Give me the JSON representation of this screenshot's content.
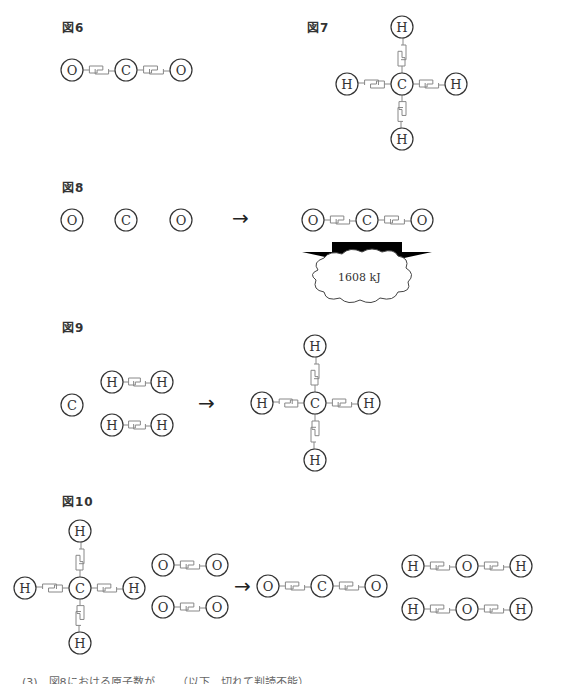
{
  "figures": {
    "fig6": {
      "label": "図6",
      "molecule": "O=C=O",
      "atoms": [
        {
          "symbol": "O",
          "x": 72,
          "y": 70
        },
        {
          "symbol": "C",
          "x": 126,
          "y": 70
        },
        {
          "symbol": "O",
          "x": 181,
          "y": 70
        }
      ],
      "bonds": [
        [
          0,
          1
        ],
        [
          1,
          2
        ]
      ]
    },
    "fig7": {
      "label": "図7",
      "molecule": "CH4",
      "atoms": [
        {
          "symbol": "C",
          "x": 402,
          "y": 84
        },
        {
          "symbol": "H",
          "x": 402,
          "y": 27
        },
        {
          "symbol": "H",
          "x": 347,
          "y": 84
        },
        {
          "symbol": "H",
          "x": 456,
          "y": 84
        },
        {
          "symbol": "H",
          "x": 402,
          "y": 139
        }
      ],
      "bonds": [
        [
          0,
          1
        ],
        [
          0,
          2
        ],
        [
          0,
          3
        ],
        [
          0,
          4
        ]
      ]
    },
    "fig8": {
      "label": "図8",
      "reactants": [
        {
          "symbol": "O",
          "x": 72,
          "y": 220
        },
        {
          "symbol": "C",
          "x": 126,
          "y": 220
        },
        {
          "symbol": "O",
          "x": 181,
          "y": 220
        }
      ],
      "arrow": "→",
      "product": {
        "atoms": [
          {
            "symbol": "O",
            "x": 313,
            "y": 220
          },
          {
            "symbol": "C",
            "x": 367,
            "y": 220
          },
          {
            "symbol": "O",
            "x": 422,
            "y": 220
          }
        ],
        "bonds": [
          [
            0,
            1
          ],
          [
            1,
            2
          ]
        ]
      },
      "energy_released": "1608 kJ"
    },
    "fig9": {
      "label": "図9",
      "reactants": {
        "carbon": {
          "symbol": "C",
          "x": 72,
          "y": 405
        },
        "h2_molecules": [
          {
            "atoms": [
              {
                "symbol": "H",
                "x": 112,
                "y": 382
              },
              {
                "symbol": "H",
                "x": 162,
                "y": 382
              }
            ]
          },
          {
            "atoms": [
              {
                "symbol": "H",
                "x": 112,
                "y": 425
              },
              {
                "symbol": "H",
                "x": 162,
                "y": 425
              }
            ]
          }
        ]
      },
      "arrow": "→",
      "product": {
        "atoms": [
          {
            "symbol": "C",
            "x": 315,
            "y": 403
          },
          {
            "symbol": "H",
            "x": 315,
            "y": 346
          },
          {
            "symbol": "H",
            "x": 262,
            "y": 403
          },
          {
            "symbol": "H",
            "x": 369,
            "y": 403
          },
          {
            "symbol": "H",
            "x": 315,
            "y": 460
          }
        ],
        "bonds": [
          [
            0,
            1
          ],
          [
            0,
            2
          ],
          [
            0,
            3
          ],
          [
            0,
            4
          ]
        ]
      }
    },
    "fig10": {
      "label": "図10",
      "methane": {
        "atoms": [
          {
            "symbol": "C",
            "x": 80,
            "y": 588
          },
          {
            "symbol": "H",
            "x": 80,
            "y": 531
          },
          {
            "symbol": "H",
            "x": 25,
            "y": 588
          },
          {
            "symbol": "H",
            "x": 134,
            "y": 588
          },
          {
            "symbol": "H",
            "x": 80,
            "y": 643
          }
        ],
        "bonds": [
          [
            0,
            1
          ],
          [
            0,
            2
          ],
          [
            0,
            3
          ],
          [
            0,
            4
          ]
        ]
      },
      "o2_molecules": [
        {
          "atoms": [
            {
              "symbol": "O",
              "x": 163,
              "y": 565
            },
            {
              "symbol": "O",
              "x": 217,
              "y": 565
            }
          ]
        },
        {
          "atoms": [
            {
              "symbol": "O",
              "x": 163,
              "y": 607
            },
            {
              "symbol": "O",
              "x": 217,
              "y": 607
            }
          ]
        }
      ],
      "arrow": "→",
      "co2": {
        "atoms": [
          {
            "symbol": "O",
            "x": 268,
            "y": 586
          },
          {
            "symbol": "C",
            "x": 322,
            "y": 586
          },
          {
            "symbol": "O",
            "x": 376,
            "y": 586
          }
        ],
        "bonds": [
          [
            0,
            1
          ],
          [
            1,
            2
          ]
        ]
      },
      "h2o_molecules": [
        {
          "atoms": [
            {
              "symbol": "H",
              "x": 413,
              "y": 566
            },
            {
              "symbol": "O",
              "x": 467,
              "y": 566
            },
            {
              "symbol": "H",
              "x": 521,
              "y": 566
            }
          ],
          "bonds": [
            [
              0,
              1
            ],
            [
              1,
              2
            ]
          ]
        },
        {
          "atoms": [
            {
              "symbol": "H",
              "x": 413,
              "y": 609
            },
            {
              "symbol": "O",
              "x": 467,
              "y": 609
            },
            {
              "symbol": "H",
              "x": 521,
              "y": 609
            }
          ],
          "bonds": [
            [
              0,
              1
            ],
            [
              1,
              2
            ]
          ]
        }
      ]
    }
  },
  "bottom_note": "(3)　図8における原子数が……（以下、切れて判読不能）",
  "colors": {
    "atom_stroke": "#333333",
    "bond_stroke": "#888888",
    "text": "#333333",
    "energy_arrow": "#000000"
  }
}
